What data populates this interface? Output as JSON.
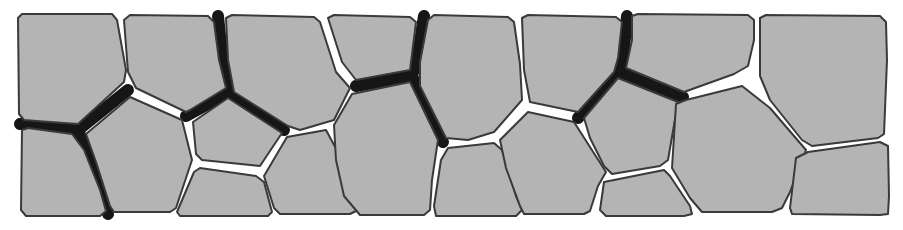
{
  "diagram": {
    "colors": {
      "background": "#ffffff",
      "cell_fill": "#b4b4b4",
      "cell_outline": "#3a3a3a",
      "dark_gap": "#161616"
    },
    "dark_gaps": [
      {
        "id": "g1",
        "points": "20,124 50,126 78,130 128,90"
      },
      {
        "id": "g2",
        "points": "78,130 92,165 108,214"
      },
      {
        "id": "g3",
        "points": "218,16 222,55 230,92"
      },
      {
        "id": "g4",
        "points": "186,116 230,92 284,130"
      },
      {
        "id": "g5",
        "points": "356,86 412,76"
      },
      {
        "id": "g6",
        "points": "424,16 418,55 412,76 443,142"
      },
      {
        "id": "g7",
        "points": "627,16 624,48 620,72 598,95 578,118"
      },
      {
        "id": "g8",
        "points": "620,72 683,97"
      }
    ],
    "cells": [
      {
        "id": "c01",
        "points": "18,18 22,14 112,14 117,20 126,70 124,82 78,124 50,122 24,120 19,114"
      },
      {
        "id": "c02",
        "points": "22,130 28,128 72,134 84,150 100,190 106,211 100,216 26,216 21,210"
      },
      {
        "id": "c03",
        "points": "124,20 130,15 208,16 214,22 219,60 226,88 190,110 186,112 136,88 128,72"
      },
      {
        "id": "c04",
        "points": "86,134 130,97 182,120 192,160 176,208 170,212 114,212 110,206 96,162"
      },
      {
        "id": "c05",
        "points": "226,18 232,15 314,17 320,22 336,72 350,88 334,120 300,130 288,126 234,92 228,60"
      },
      {
        "id": "c06",
        "points": "193,122 228,98 282,133 260,166 202,160 196,154"
      },
      {
        "id": "c07",
        "points": "177,212 194,172 200,168 256,176 264,182 272,212 268,216 180,216"
      },
      {
        "id": "c08",
        "points": "264,176 287,137 326,130 340,156 356,178 356,211 350,214 280,214 274,208"
      },
      {
        "id": "c09",
        "points": "328,18 334,15 410,17 416,22 410,70 356,80 342,62"
      },
      {
        "id": "c10",
        "points": "334,125 352,94 410,82 438,140 432,180 430,210 424,215 360,215 344,196 336,160"
      },
      {
        "id": "c11",
        "points": "428,20 434,15 508,17 514,22 520,64 522,100 494,132 468,140 446,138 420,86 420,62"
      },
      {
        "id": "c12",
        "points": "448,148 494,143 502,150 516,196 522,210 516,216 436,216 434,206 441,160"
      },
      {
        "id": "c13",
        "points": "522,18 528,15 616,17 622,22 618,58 614,72 578,112 530,102 524,70"
      },
      {
        "id": "c14",
        "points": "500,140 528,112 574,122 606,172 598,186 590,211 584,214 524,214 520,206 506,168"
      },
      {
        "id": "c15",
        "points": "632,16 638,14 748,15 754,20 754,40 748,66 734,74 684,92 626,68 632,40"
      },
      {
        "id": "c16",
        "points": "584,118 618,78 678,102 668,160 660,166 612,174 604,166 590,138"
      },
      {
        "id": "c17",
        "points": "604,182 664,170 670,176 690,206 692,214 684,216 606,216 600,210"
      },
      {
        "id": "c18",
        "points": "676,104 686,100 742,86 770,108 806,150 790,192 782,208 772,212 702,212 690,198 672,168"
      },
      {
        "id": "c19",
        "points": "760,18 766,15 880,16 886,22 887,60 884,134 878,138 812,146 802,140 770,100 760,76"
      },
      {
        "id": "c20",
        "points": "796,158 808,152 880,142 888,146 889,196 888,214 880,215 792,214 790,208"
      }
    ]
  }
}
